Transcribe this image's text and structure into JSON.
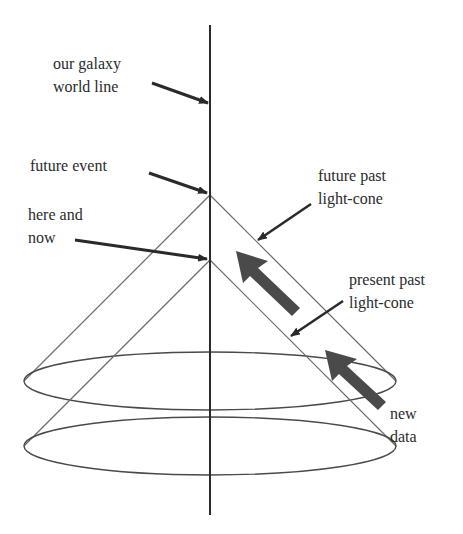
{
  "diagram": {
    "colors": {
      "line": "#2a2a2a",
      "cone": "#6b6b6b",
      "arrow": "#2a2a2a",
      "data_arrow": "#4a4a4a",
      "text": "#2b2b2b"
    },
    "labels": {
      "world_line": {
        "line1": "our galaxy",
        "line2": "world line"
      },
      "future_event": {
        "line1": "future event"
      },
      "here_and_now": {
        "line1": "here and",
        "line2": "now"
      },
      "future_past_light_cone": {
        "line1": "future past",
        "line2": "light-cone"
      },
      "present_past_light_cone": {
        "line1": "present past",
        "line2": "light-cone"
      },
      "new_data": {
        "line1": "new",
        "line2": "data"
      }
    },
    "elements": {
      "world_line": "vertical line",
      "future_event_apex": "apex of future past light-cone",
      "here_and_now_apex": "apex of present past light-cone",
      "future_cone_base": "ellipse",
      "present_cone_base": "ellipse",
      "data_arrows": "2 thick arrows pointing up-left along the cone"
    }
  }
}
